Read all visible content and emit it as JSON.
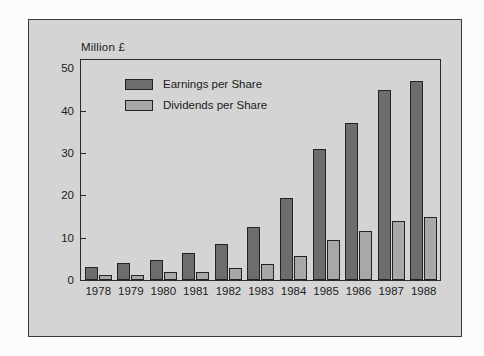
{
  "chart_data": {
    "type": "bar",
    "title": "",
    "subtitle": "",
    "unit_caption": "Million £",
    "xlabel": "",
    "ylabel": "",
    "categories": [
      "1978",
      "1979",
      "1980",
      "1981",
      "1982",
      "1983",
      "1984",
      "1985",
      "1986",
      "1987",
      "1988"
    ],
    "series": [
      {
        "name": "Earnings per Share",
        "color": "#6d6d6d",
        "values": [
          3.0,
          4.0,
          4.8,
          6.5,
          8.5,
          12.5,
          19.5,
          31.0,
          37.0,
          45.0,
          47.0
        ]
      },
      {
        "name": "Dividends per Share",
        "color": "#a8a8a8",
        "values": [
          1.3,
          1.2,
          2.0,
          1.9,
          2.8,
          3.8,
          5.6,
          9.5,
          11.5,
          14.0,
          15.0
        ]
      }
    ],
    "ylim": [
      0,
      52
    ],
    "yticks": [
      0,
      10,
      20,
      30,
      40,
      50
    ],
    "ytick_labels": [
      "0",
      "10",
      "20",
      "30",
      "40",
      "50"
    ],
    "grid": false,
    "legend_position": "upper-left-inside",
    "legend_entries": [
      "Earnings per Share",
      "Dividends per Share"
    ]
  },
  "figure": {
    "panel_background": "#d4d4d4",
    "page_background": "#fcfcfc",
    "frame_color": "#2b2b2b",
    "text_color": "#1b1b1b"
  }
}
